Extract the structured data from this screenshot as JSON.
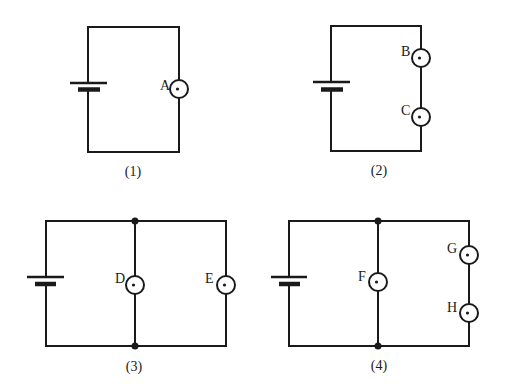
{
  "diagram": {
    "type": "circuit-diagrams",
    "colors": {
      "stroke": "#1a1a1a",
      "background": "#ffffff"
    },
    "circuits": [
      {
        "id": "1",
        "caption": "(1)",
        "configuration": "single bulb in series with battery",
        "bulbs": [
          {
            "label": "A"
          }
        ]
      },
      {
        "id": "2",
        "caption": "(2)",
        "configuration": "two bulbs in series with battery",
        "bulbs": [
          {
            "label": "B"
          },
          {
            "label": "C"
          }
        ]
      },
      {
        "id": "3",
        "caption": "(3)",
        "configuration": "two bulbs in parallel with battery",
        "bulbs": [
          {
            "label": "D"
          },
          {
            "label": "E"
          }
        ]
      },
      {
        "id": "4",
        "caption": "(4)",
        "configuration": "bulb F in parallel with series pair G and H",
        "bulbs": [
          {
            "label": "F"
          },
          {
            "label": "G"
          },
          {
            "label": "H"
          }
        ]
      }
    ]
  }
}
